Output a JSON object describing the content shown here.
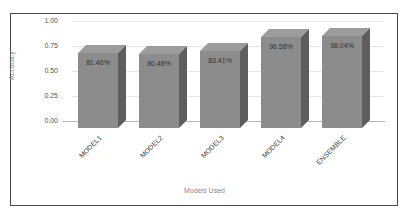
{
  "chart_data": {
    "type": "bar",
    "style": "3d-column",
    "title": "",
    "xlabel": "Models Used",
    "ylabel": "Accuracy",
    "categories": [
      "MODEL1",
      "MODEL2",
      "MODEL3",
      "MODEL4",
      "ENSEMBLE"
    ],
    "values": [
      0.8146,
      0.8048,
      0.8341,
      0.9658,
      0.9804
    ],
    "data_labels": [
      "81.46%",
      "80.48%",
      "83.41%",
      "96.58%",
      "98.04%"
    ],
    "ylim": [
      0,
      1.0
    ],
    "yticks": [
      "1.00",
      "0.75",
      "0.50",
      "0.25",
      "0.00"
    ],
    "grid": true,
    "legend": false,
    "bar_color": "#8c8c8c"
  }
}
